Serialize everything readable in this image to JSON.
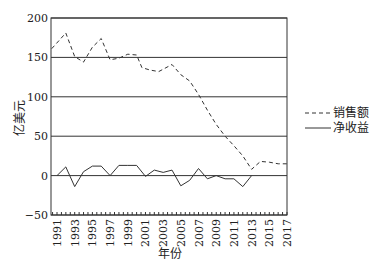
{
  "chart_data": {
    "type": "line",
    "title": "",
    "xlabel": "年份",
    "ylabel": "亿美元",
    "ylim": [
      -50,
      200
    ],
    "xlim": [
      1990.4,
      2017
    ],
    "yticks": [
      200,
      150,
      100,
      50,
      0,
      -50
    ],
    "xticks": [
      "1991",
      "1993",
      "1995",
      "1997",
      "1999",
      "2001",
      "2003",
      "2005",
      "2007",
      "2009",
      "2011",
      "2013",
      "2015",
      "2017"
    ],
    "grid": "horizontal",
    "legend_position": "right",
    "series": [
      {
        "name": "销售额",
        "style": "dashed",
        "points": [
          [
            1990.4,
            161
          ],
          [
            1992,
            181
          ],
          [
            1993,
            151
          ],
          [
            1994,
            144
          ],
          [
            1995,
            163
          ],
          [
            1996,
            174
          ],
          [
            1997,
            147
          ],
          [
            1998,
            149
          ],
          [
            1999,
            154
          ],
          [
            2000,
            153
          ],
          [
            2000.6,
            137
          ],
          [
            2001.5,
            134
          ],
          [
            2002.5,
            132
          ],
          [
            2004,
            141
          ],
          [
            2005,
            128
          ],
          [
            2006,
            120
          ],
          [
            2007,
            103
          ],
          [
            2008,
            83
          ],
          [
            2009,
            65
          ],
          [
            2010,
            50
          ],
          [
            2011,
            38
          ],
          [
            2012,
            25
          ],
          [
            2013,
            8
          ],
          [
            2014,
            18
          ],
          [
            2015,
            17
          ],
          [
            2016,
            15
          ],
          [
            2017,
            15
          ]
        ]
      },
      {
        "name": "净收益",
        "style": "solid",
        "points": [
          [
            1991,
            0
          ],
          [
            1992,
            11
          ],
          [
            1993,
            -14
          ],
          [
            1994,
            5
          ],
          [
            1995,
            12
          ],
          [
            1996,
            12
          ],
          [
            1997,
            0
          ],
          [
            1998,
            13
          ],
          [
            1999,
            13
          ],
          [
            2000,
            13
          ],
          [
            2001,
            -1
          ],
          [
            2002,
            7
          ],
          [
            2003,
            4
          ],
          [
            2004,
            7
          ],
          [
            2005,
            -13
          ],
          [
            2006,
            -6
          ],
          [
            2007,
            9
          ],
          [
            2008,
            -4
          ],
          [
            2009,
            0
          ],
          [
            2010,
            -4
          ],
          [
            2011,
            -4
          ],
          [
            2012,
            -14
          ],
          [
            2013,
            0
          ]
        ]
      }
    ]
  },
  "legend": {
    "items": [
      {
        "label": "销售额",
        "style": "dashed"
      },
      {
        "label": "净收益",
        "style": "solid"
      }
    ]
  },
  "axes": {
    "x_title": "年份",
    "y_title": "亿美元"
  }
}
